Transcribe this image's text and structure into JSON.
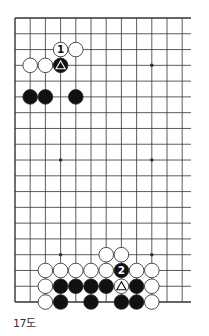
{
  "diagram": {
    "caption": "17도",
    "grid": {
      "columns": 12,
      "rows": 19,
      "origin_x": 15,
      "origin_y": 18,
      "step_x": 15.2,
      "step_y": 15.78,
      "right_extend": 191,
      "open_right": true
    },
    "star_points": [
      [
        9,
        3
      ],
      [
        3,
        9
      ],
      [
        9,
        9
      ],
      [
        3,
        15
      ],
      [
        9,
        15
      ]
    ],
    "stones": [
      {
        "col": 3,
        "row": 2,
        "color": "white",
        "label": "1"
      },
      {
        "col": 4,
        "row": 2,
        "color": "white"
      },
      {
        "col": 1,
        "row": 3,
        "color": "white"
      },
      {
        "col": 2,
        "row": 3,
        "color": "white"
      },
      {
        "col": 3,
        "row": 3,
        "color": "black",
        "mark": "triangle"
      },
      {
        "col": 1,
        "row": 5,
        "color": "black"
      },
      {
        "col": 2,
        "row": 5,
        "color": "black"
      },
      {
        "col": 4,
        "row": 5,
        "color": "black"
      },
      {
        "col": 6,
        "row": 15,
        "color": "white"
      },
      {
        "col": 7,
        "row": 15,
        "color": "white"
      },
      {
        "col": 2,
        "row": 16,
        "color": "white"
      },
      {
        "col": 3,
        "row": 16,
        "color": "white"
      },
      {
        "col": 4,
        "row": 16,
        "color": "white"
      },
      {
        "col": 5,
        "row": 16,
        "color": "white"
      },
      {
        "col": 6,
        "row": 16,
        "color": "white"
      },
      {
        "col": 7,
        "row": 16,
        "color": "black",
        "label": "2"
      },
      {
        "col": 8,
        "row": 16,
        "color": "white"
      },
      {
        "col": 9,
        "row": 16,
        "color": "white"
      },
      {
        "col": 2,
        "row": 17,
        "color": "white"
      },
      {
        "col": 3,
        "row": 17,
        "color": "black"
      },
      {
        "col": 4,
        "row": 17,
        "color": "black"
      },
      {
        "col": 5,
        "row": 17,
        "color": "black"
      },
      {
        "col": 6,
        "row": 17,
        "color": "black"
      },
      {
        "col": 7,
        "row": 17,
        "color": "white",
        "mark": "triangle"
      },
      {
        "col": 8,
        "row": 17,
        "color": "black"
      },
      {
        "col": 9,
        "row": 17,
        "color": "white"
      },
      {
        "col": 2,
        "row": 18,
        "color": "white"
      },
      {
        "col": 3,
        "row": 18,
        "color": "black"
      },
      {
        "col": 5,
        "row": 18,
        "color": "black"
      },
      {
        "col": 7,
        "row": 18,
        "color": "black"
      },
      {
        "col": 8,
        "row": 18,
        "color": "black"
      },
      {
        "col": 9,
        "row": 18,
        "color": "white"
      }
    ],
    "colors": {
      "line": "#333333",
      "black_stone": "#111111",
      "white_stone": "#ffffff",
      "stone_outline": "#222222"
    }
  }
}
